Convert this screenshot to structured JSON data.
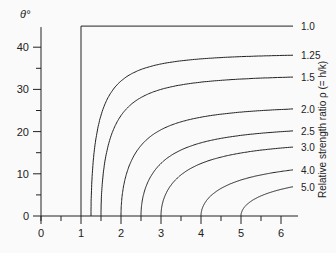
{
  "chart_data": {
    "type": "line",
    "title": "",
    "xlabel": "",
    "ylabel": "θ°",
    "right_label": "Relative strength ratio ρ (= h/k)",
    "xlim": [
      0,
      6.3
    ],
    "ylim": [
      0,
      45
    ],
    "x_ticks": [
      0,
      1,
      2,
      3,
      4,
      5,
      6
    ],
    "x_minor_ticks": [
      0.5,
      1.5,
      2.5,
      3.5,
      4.5,
      5.5
    ],
    "y_ticks": [
      0,
      10,
      20,
      30,
      40
    ],
    "y_minor_ticks": [
      5,
      15,
      25,
      35
    ],
    "grid": false,
    "series": [
      {
        "name": "1.0",
        "rho": 1.0,
        "points": [
          [
            1,
            0
          ],
          [
            1,
            45
          ],
          [
            6.3,
            45
          ]
        ]
      },
      {
        "name": "1.25",
        "rho": 1.25,
        "end_value_at_x6": 38.5
      },
      {
        "name": "1.5",
        "rho": 1.5,
        "end_value_at_x6": 33.5
      },
      {
        "name": "2.0",
        "rho": 2.0,
        "end_value_at_x6": 25.5
      },
      {
        "name": "2.5",
        "rho": 2.5,
        "end_value_at_x6": 21
      },
      {
        "name": "3.0",
        "rho": 3.0,
        "end_value_at_x6": 16.5
      },
      {
        "name": "4.0",
        "rho": 4.0,
        "end_value_at_x6": 10.8
      },
      {
        "name": "5.0",
        "rho": 5.0,
        "end_value_at_x6": 6.8
      }
    ]
  }
}
